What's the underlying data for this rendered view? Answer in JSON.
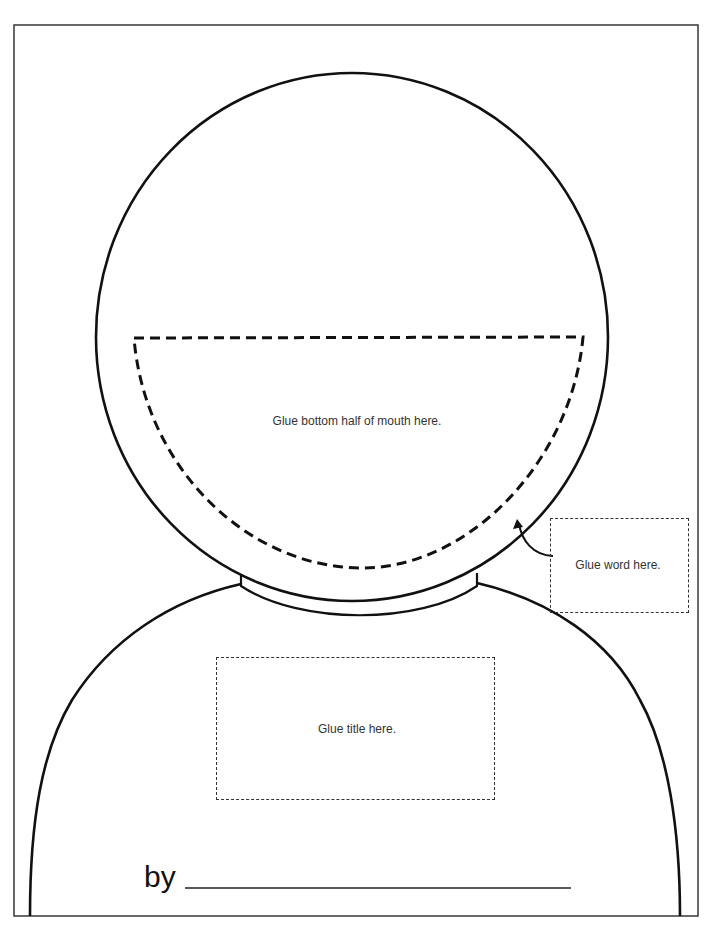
{
  "worksheet": {
    "mouth_area": {
      "label": "Glue bottom half of mouth here."
    },
    "word_box": {
      "label": "Glue word here."
    },
    "title_box": {
      "label": "Glue title here."
    },
    "byline": {
      "label": "by",
      "name_line_value": ""
    }
  },
  "colors": {
    "outline": "#111111",
    "frame": "#444444",
    "text": "#333333",
    "background": "#ffffff"
  }
}
